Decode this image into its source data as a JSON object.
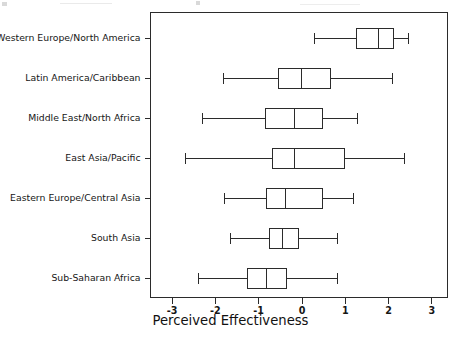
{
  "figure": {
    "kind": "box-plot-figure",
    "background_color": "#ffffff",
    "line_color": "#2b2b2b"
  },
  "chart_data": {
    "type": "box",
    "orientation": "horizontal",
    "title": "",
    "xlabel": "Perceived Effectiveness",
    "ylabel": "",
    "xlim": [
      -3.45,
      3.35
    ],
    "xticks": [
      -3,
      -2,
      -1,
      0,
      1,
      2,
      3
    ],
    "xticklabels": [
      "-3",
      "-2",
      "-1",
      "0",
      "1",
      "2",
      "3"
    ],
    "grid": false,
    "legend": null,
    "categories": [
      "Western Europe/North America",
      "Latin America/Caribbean",
      "Middle East/North Africa",
      "East Asia/Pacific",
      "Eastern Europe/Central Asia",
      "South Asia",
      "Sub-Saharan Africa"
    ],
    "boxes": [
      {
        "category": "Western Europe/North America",
        "whisker_low": 0.3,
        "q1": 1.27,
        "median": 1.76,
        "q3": 2.12,
        "whisker_high": 2.45
      },
      {
        "category": "Latin America/Caribbean",
        "whisker_low": -1.82,
        "q1": -0.55,
        "median": -0.02,
        "q3": 0.65,
        "whisker_high": 2.08
      },
      {
        "category": "Middle East/North Africa",
        "whisker_low": -2.29,
        "q1": -0.85,
        "median": -0.18,
        "q3": 0.48,
        "whisker_high": 1.29
      },
      {
        "category": "East Asia/Pacific",
        "whisker_low": -2.7,
        "q1": -0.67,
        "median": -0.18,
        "q3": 0.97,
        "whisker_high": 2.36
      },
      {
        "category": "Eastern Europe/Central Asia",
        "whisker_low": -1.78,
        "q1": -0.81,
        "median": -0.39,
        "q3": 0.48,
        "whisker_high": 1.18
      },
      {
        "category": "South Asia",
        "whisker_low": -1.66,
        "q1": -0.74,
        "median": -0.46,
        "q3": -0.09,
        "whisker_high": 0.83
      },
      {
        "category": "Sub-Saharan Africa",
        "whisker_low": -2.4,
        "q1": -1.25,
        "median": -0.81,
        "q3": -0.35,
        "whisker_high": 0.81
      }
    ]
  }
}
